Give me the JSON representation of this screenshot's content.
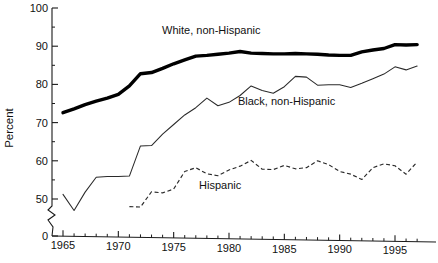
{
  "chart_data": {
    "type": "line",
    "title": "",
    "xlabel": "",
    "ylabel": "Percent",
    "xlim": [
      1964,
      1997.5
    ],
    "ylim": [
      45,
      100
    ],
    "ylim_display": [
      0,
      100
    ],
    "grid": false,
    "legend_position": "inline-annotations",
    "axis_break": true,
    "axis_break_note": "y-axis broken between 0 and 50",
    "ytick_labels": [
      "0",
      "50",
      "60",
      "70",
      "80",
      "90",
      "100"
    ],
    "ytick_values": [
      0,
      50,
      60,
      70,
      80,
      90,
      100
    ],
    "yminor_values": [
      55,
      65,
      75,
      85,
      95
    ],
    "xtick_labels": [
      "1965",
      "1970",
      "1975",
      "1980",
      "1985",
      "1990",
      "1995"
    ],
    "xtick_values": [
      1965,
      1970,
      1975,
      1980,
      1985,
      1990,
      1995
    ],
    "xminor_values": [
      1966,
      1967,
      1968,
      1969,
      1971,
      1972,
      1973,
      1974,
      1976,
      1977,
      1978,
      1979,
      1981,
      1982,
      1983,
      1984,
      1986,
      1987,
      1988,
      1989,
      1991,
      1992,
      1993,
      1994,
      1996,
      1997
    ],
    "series": [
      {
        "name": "White, non-Hispanic",
        "style": "thick-solid",
        "color": "#000000",
        "label_x": 1978.4,
        "label_y": 93.2,
        "x": [
          1965,
          1966,
          1967,
          1968,
          1969,
          1970,
          1971,
          1972,
          1973,
          1974,
          1975,
          1976,
          1977,
          1978,
          1979,
          1980,
          1981,
          1982,
          1983,
          1984,
          1985,
          1986,
          1987,
          1988,
          1989,
          1990,
          1991,
          1992,
          1993,
          1994,
          1995,
          1996,
          1997
        ],
        "values": [
          72.6,
          73.6,
          74.7,
          75.6,
          76.4,
          77.4,
          79.6,
          82.8,
          83.1,
          84.2,
          85.4,
          86.4,
          87.4,
          87.6,
          87.9,
          88.2,
          88.6,
          88.2,
          88.1,
          88.0,
          88.0,
          88.1,
          88.0,
          87.9,
          87.7,
          87.6,
          87.6,
          88.5,
          89.0,
          89.4,
          90.4,
          90.3,
          90.4
        ]
      },
      {
        "name": "Black, non-Hispanic",
        "style": "thin-solid",
        "color": "#2a2a2a",
        "label_x": 1985.2,
        "label_y": 74.5,
        "x": [
          1965,
          1966,
          1967,
          1968,
          1969,
          1970,
          1971,
          1972,
          1973,
          1974,
          1975,
          1976,
          1977,
          1978,
          1979,
          1980,
          1981,
          1982,
          1983,
          1984,
          1985,
          1986,
          1987,
          1988,
          1989,
          1990,
          1991,
          1992,
          1993,
          1994,
          1995,
          1996,
          1997
        ],
        "values": [
          51.2,
          47.0,
          51.8,
          55.7,
          55.9,
          55.9,
          56.0,
          63.9,
          64.0,
          67.0,
          69.5,
          72.0,
          73.9,
          76.4,
          74.4,
          75.3,
          77.1,
          79.6,
          78.4,
          77.7,
          79.4,
          82.1,
          81.9,
          79.8,
          79.9,
          79.9,
          79.2,
          80.3,
          81.5,
          82.7,
          84.6,
          83.8,
          84.8
        ]
      },
      {
        "name": "Hispanic",
        "style": "dashed",
        "color": "#2a2a2a",
        "label_x": 1979.2,
        "label_y": 52.6,
        "x": [
          1971,
          1972,
          1973,
          1974,
          1975,
          1976,
          1977,
          1978,
          1979,
          1980,
          1981,
          1982,
          1983,
          1984,
          1985,
          1986,
          1987,
          1988,
          1989,
          1990,
          1991,
          1992,
          1993,
          1994,
          1995,
          1996,
          1997
        ],
        "values": [
          48.0,
          47.9,
          51.9,
          51.6,
          52.6,
          57.2,
          58.2,
          56.6,
          56.1,
          57.6,
          58.6,
          60.1,
          57.8,
          57.7,
          58.8,
          57.9,
          58.2,
          60.0,
          59.0,
          57.2,
          56.5,
          55.1,
          58.2,
          59.2,
          58.7,
          56.5,
          59.7
        ]
      }
    ]
  }
}
